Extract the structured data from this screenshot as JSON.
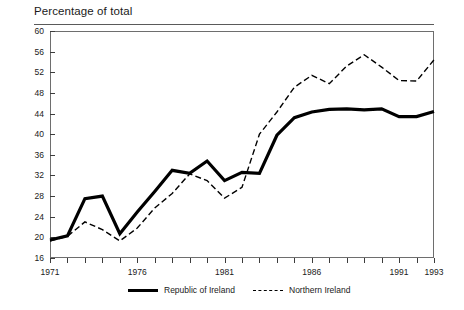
{
  "chart_data": {
    "type": "line",
    "title": "Percentage of total",
    "subtitle": "",
    "xlabel": "",
    "ylabel": "",
    "xlim": [
      1971,
      1993
    ],
    "ylim": [
      16,
      60
    ],
    "yticks": [
      16,
      20,
      24,
      28,
      32,
      36,
      40,
      44,
      48,
      52,
      56,
      60
    ],
    "ytick_labels": [
      "16",
      "20",
      "24",
      "28",
      "32",
      "36",
      "40",
      "44",
      "48",
      "52",
      "56",
      "60"
    ],
    "xticks": [
      1971,
      1972,
      1973,
      1974,
      1975,
      1976,
      1977,
      1978,
      1979,
      1980,
      1981,
      1982,
      1983,
      1984,
      1985,
      1986,
      1987,
      1988,
      1989,
      1990,
      1991,
      1992,
      1993
    ],
    "xtick_labels_shown": [
      "1971",
      "1976",
      "1981",
      "1986",
      "1991",
      "1993"
    ],
    "xtick_labels_shown_values": [
      1971,
      1976,
      1981,
      1986,
      1991,
      1993
    ],
    "grid": false,
    "legend_position": "bottom",
    "x": [
      1971,
      1972,
      1973,
      1974,
      1975,
      1976,
      1977,
      1978,
      1979,
      1980,
      1981,
      1982,
      1983,
      1984,
      1985,
      1986,
      1987,
      1988,
      1989,
      1990,
      1991,
      1992,
      1993
    ],
    "series": [
      {
        "name": "Republic of Ireland",
        "style": "solid",
        "color": "#000000",
        "values": [
          19.5,
          20.3,
          27.5,
          28.0,
          20.7,
          24.9,
          28.9,
          33.0,
          32.4,
          34.8,
          31.0,
          32.6,
          32.4,
          39.8,
          43.2,
          44.3,
          44.8,
          44.9,
          44.7,
          44.9,
          43.4,
          43.4,
          44.4
        ]
      },
      {
        "name": "Northern Ireland",
        "style": "dashed",
        "color": "#000000",
        "values": [
          19.3,
          20.2,
          23.0,
          21.5,
          19.3,
          21.8,
          25.7,
          28.5,
          32.3,
          31.0,
          27.6,
          29.7,
          40.0,
          44.3,
          49.1,
          51.4,
          49.8,
          53.2,
          55.4,
          53.0,
          50.4,
          50.3,
          54.4
        ]
      }
    ]
  },
  "legend": {
    "entries": [
      {
        "label": "Republic of Ireland",
        "style": "solid"
      },
      {
        "label": "Northern Ireland",
        "style": "dashed"
      }
    ]
  }
}
